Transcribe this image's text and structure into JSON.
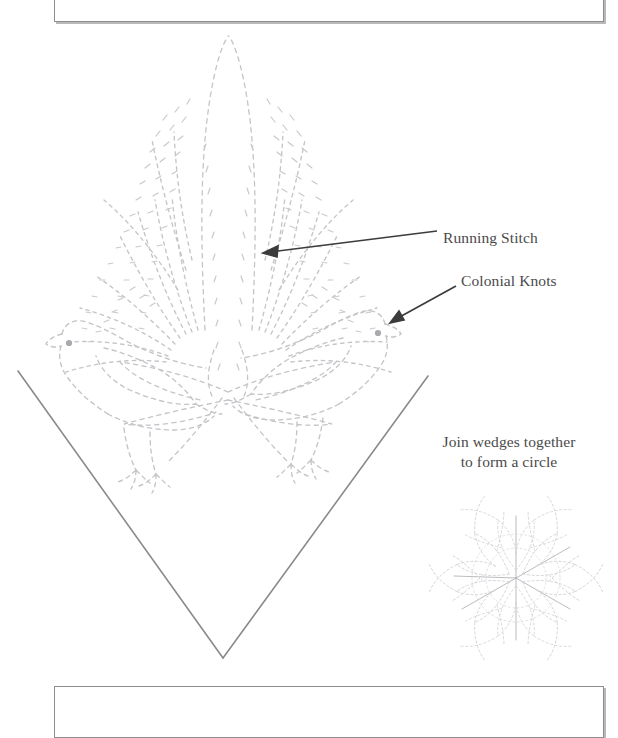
{
  "document": {
    "kind": "embroidery-pattern-template",
    "title_visible": false
  },
  "frame": {
    "top_rule": "",
    "bottom_rule": ""
  },
  "annotations": [
    {
      "id": "running-stitch",
      "text": "Running Stitch"
    },
    {
      "id": "colonial-knots",
      "text": "Colonial Knots"
    }
  ],
  "labels": {
    "running_stitch": "Running Stitch",
    "colonial_knots": "Colonial Knots",
    "join_wedges_line1": "Join wedges together",
    "join_wedges_line2": "to form a circle"
  },
  "colors": {
    "stitch_line": "#c4c4c9",
    "knot_dot": "#a8a8ad",
    "wedge_edge": "#8a8a8a",
    "arrow": "#3c3c3c",
    "label_text": "#4a4a4a",
    "frame_rule": "#8d8d8d",
    "frame_shadow": "#b9b9b9",
    "thumbnail": "#d7d7db",
    "paper": "#ffffff"
  },
  "artwork": {
    "wedge": {
      "shape": "v-wedge",
      "apex": [
        223,
        658
      ],
      "left_top": [
        18,
        371
      ],
      "right_top": [
        428,
        376
      ]
    },
    "motifs": [
      {
        "name": "center-plume",
        "description": "tall feathered fern spray, running stitch"
      },
      {
        "name": "left-bird",
        "description": "bird outline facing left, running stitch",
        "eye": [
          69,
          343
        ]
      },
      {
        "name": "right-bird",
        "description": "bird outline facing right, running stitch",
        "eye": [
          378,
          333
        ]
      },
      {
        "name": "petal-spray",
        "description": "leaf and petal spray between the birds"
      }
    ],
    "thumbnail": {
      "name": "assembled-circle-preview",
      "center": [
        516,
        578
      ],
      "radius": 78,
      "wedge_count": 6
    }
  },
  "arrows": [
    {
      "id": "arrow-running-stitch",
      "from": [
        437,
        231
      ],
      "to": [
        264,
        253
      ]
    },
    {
      "id": "arrow-colonial-knots",
      "from": [
        456,
        286
      ],
      "to": [
        391,
        323
      ]
    }
  ]
}
